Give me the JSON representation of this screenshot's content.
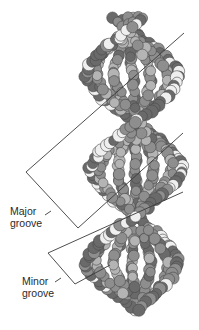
{
  "figure": {
    "labels": {
      "major_groove": [
        "Major",
        "groove"
      ],
      "minor_groove": [
        "Minor",
        "groove"
      ]
    },
    "colors": {
      "background": "#ffffff",
      "atom_dark": "#6a6a6a",
      "atom_mid": "#8e8e8e",
      "atom_light": "#b4b4b4",
      "atom_white": "#efefef",
      "outline": "#4a4a4a",
      "pointer_line": "#3a3a3a"
    }
  }
}
